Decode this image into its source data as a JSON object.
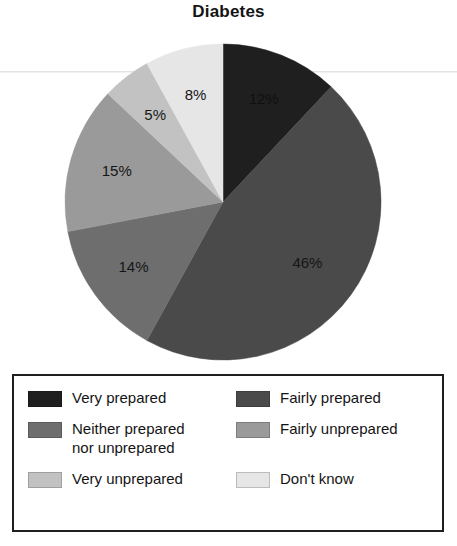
{
  "chart_data": {
    "type": "pie",
    "title": "Diabetes",
    "xlabel": "",
    "ylabel": "",
    "categories": [
      "Very prepared",
      "Fairly prepared",
      "Neither prepared nor unprepared",
      "Fairly unprepared",
      "Very unprepared",
      "Don't know"
    ],
    "values": [
      12,
      46,
      14,
      15,
      5,
      8
    ],
    "value_labels": [
      "12%",
      "46%",
      "14%",
      "15%",
      "5%",
      "8%"
    ],
    "colors": [
      "#1f1f1f",
      "#4a4a4a",
      "#6e6e6e",
      "#9a9a9a",
      "#c2c2c2",
      "#e6e6e6"
    ],
    "start_angle_deg": 0,
    "direction": "clockwise",
    "legend_position": "bottom",
    "grid": false,
    "slices": [
      {
        "label": "Very prepared",
        "value": 12,
        "display": "12%",
        "color": "#1f1f1f",
        "label_on_dark": true
      },
      {
        "label": "Fairly prepared",
        "value": 46,
        "display": "46%",
        "color": "#4a4a4a",
        "label_on_dark": false
      },
      {
        "label": "Neither prepared nor unprepared",
        "value": 14,
        "display": "14%",
        "color": "#6e6e6e",
        "label_on_dark": false
      },
      {
        "label": "Fairly unprepared",
        "value": 15,
        "display": "15%",
        "color": "#9a9a9a",
        "label_on_dark": false
      },
      {
        "label": "Very unprepared",
        "value": 5,
        "display": "5%",
        "color": "#c2c2c2",
        "label_on_dark": false
      },
      {
        "label": "Don't know",
        "value": 8,
        "display": "8%",
        "color": "#e6e6e6",
        "label_on_dark": false
      }
    ]
  },
  "title": "Diabetes",
  "legend": {
    "items": [
      {
        "label": "Very prepared",
        "color": "#1f1f1f"
      },
      {
        "label": "Fairly prepared",
        "color": "#4a4a4a"
      },
      {
        "label": "Neither prepared\nnor unprepared",
        "color": "#6e6e6e"
      },
      {
        "label": "Fairly unprepared",
        "color": "#9a9a9a"
      },
      {
        "label": "Very unprepared",
        "color": "#c2c2c2"
      },
      {
        "label": "Don't know",
        "color": "#e6e6e6"
      }
    ]
  }
}
